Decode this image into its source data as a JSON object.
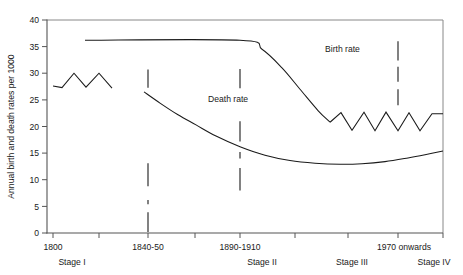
{
  "chart_data": {
    "type": "line",
    "title": "",
    "xlabel": "",
    "ylabel": "Annual birth and death rates per 1000",
    "ylim": [
      0,
      40
    ],
    "ytick_labels": [
      "0",
      "5",
      "10",
      "15",
      "20",
      "25",
      "30",
      "35",
      "40"
    ],
    "ytick_values": [
      0,
      5,
      10,
      15,
      20,
      25,
      30,
      35,
      40
    ],
    "grid": false,
    "legend_position": "inline-annotations",
    "xtick_labels": [
      "1800",
      "1840-50",
      "1890-1910",
      "1970 onwards"
    ],
    "xtick_label_positions": [
      1800,
      1845,
      1900,
      1970
    ],
    "stage_labels": [
      "Stage I",
      "Stage II",
      "Stage III",
      "Stage IV"
    ],
    "annotations": [
      {
        "text": "Birth rate",
        "x": 325,
        "y": 52
      },
      {
        "text": "Death rate",
        "x": 208,
        "y": 102
      }
    ],
    "series": [
      {
        "name": "Birth rate",
        "segments": [
          {
            "name": "stage-II-plateau-and-decline",
            "points": [
              [
                85,
                36.2
              ],
              [
                240,
                36.2
              ],
              [
                262,
                34.5
              ],
              [
                282,
                31.0
              ],
              [
                300,
                27.0
              ],
              [
                318,
                23.0
              ],
              [
                330,
                20.8
              ]
            ]
          },
          {
            "name": "stage-III-IV-oscillation",
            "points": [
              [
                330,
                20.8
              ],
              [
                341,
                22.6
              ],
              [
                352,
                19.3
              ],
              [
                364,
                22.7
              ],
              [
                375,
                19.2
              ],
              [
                386,
                22.7
              ],
              [
                398,
                19.2
              ],
              [
                409,
                22.6
              ],
              [
                420,
                19.2
              ],
              [
                432,
                22.4
              ],
              [
                443,
                22.4
              ]
            ]
          }
        ]
      },
      {
        "name": "Death rate",
        "segments": [
          {
            "name": "stage-I-fluctuation",
            "points": [
              [
                53,
                27.6
              ],
              [
                62,
                27.3
              ],
              [
                74,
                30.0
              ],
              [
                86,
                27.4
              ],
              [
                99,
                30.0
              ],
              [
                112,
                27.2
              ]
            ]
          },
          {
            "name": "stage-II-IV-decline-and-rise",
            "points": [
              [
                144,
                26.5
              ],
              [
                160,
                24.4
              ],
              [
                178,
                22.2
              ],
              [
                196,
                20.3
              ],
              [
                216,
                18.2
              ],
              [
                240,
                16.2
              ],
              [
                265,
                14.6
              ],
              [
                290,
                13.6
              ],
              [
                315,
                13.1
              ],
              [
                340,
                12.9
              ],
              [
                362,
                13.0
              ],
              [
                385,
                13.4
              ],
              [
                408,
                14.1
              ],
              [
                425,
                14.7
              ],
              [
                443,
                15.4
              ]
            ]
          }
        ]
      }
    ],
    "stage_dividers": [
      {
        "x": 148,
        "segments": [
          [
            8.8,
            13.1
          ],
          [
            5.4,
            6.2
          ],
          [
            0.2,
            3.9
          ],
          [
            27.3,
            30.7
          ]
        ]
      },
      {
        "x": 240,
        "segments": [
          [
            8.0,
            12.2
          ],
          [
            14.0,
            15.2
          ],
          [
            17.2,
            21.0
          ],
          [
            27.2,
            30.8
          ]
        ]
      },
      {
        "x": 398,
        "segments": [
          [
            24.0,
            27.0
          ],
          [
            28.4,
            31.2
          ],
          [
            32.4,
            36.0
          ]
        ]
      }
    ]
  }
}
